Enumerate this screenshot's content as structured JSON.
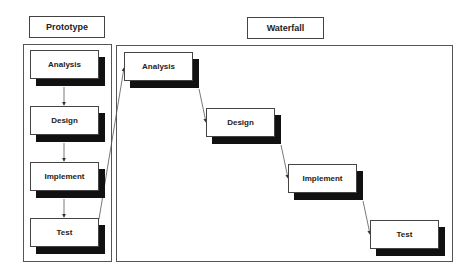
{
  "labels": {
    "prototype": "Prototype",
    "waterfall": "Waterfall"
  },
  "prototype": {
    "steps": [
      {
        "label": "Analysis"
      },
      {
        "label": "Design"
      },
      {
        "label": "Implement"
      },
      {
        "label": "Test"
      }
    ]
  },
  "waterfall": {
    "steps": [
      {
        "label": "Analysis"
      },
      {
        "label": "Design"
      },
      {
        "label": "Implement"
      },
      {
        "label": "Test"
      }
    ]
  }
}
